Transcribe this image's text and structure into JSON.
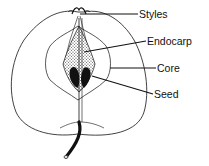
{
  "diagram": {
    "labels": [
      {
        "id": "styles",
        "text": "Styles"
      },
      {
        "id": "endocarp",
        "text": "Endocarp"
      },
      {
        "id": "core",
        "text": "Core"
      },
      {
        "id": "seed",
        "text": "Seed"
      }
    ]
  },
  "colors": {
    "line": "#111111",
    "background": "#ffffff",
    "seed": "#111111"
  }
}
